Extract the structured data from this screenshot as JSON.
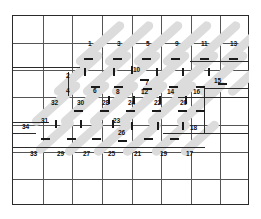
{
  "diagram": {
    "grid": {
      "columns": 8,
      "rows": 7,
      "cell_width": 29.6,
      "cell_height": 27.1,
      "line_color": "#555555",
      "frame_color": "#2b2b2b",
      "background": "#ffffff"
    },
    "hatch": {
      "color": "#dcdcdc",
      "angle_degrees": -42,
      "band_count": 7
    },
    "labels": {
      "top_row": [
        "1",
        "3",
        "5",
        "9",
        "11",
        "13"
      ],
      "second_row": [
        "2",
        "10",
        "7",
        "15"
      ],
      "third_row": [
        "4",
        "6",
        "8",
        "12",
        "14",
        "16"
      ],
      "fourth_row": [
        "32",
        "30",
        "28",
        "24",
        "22",
        "20"
      ],
      "fifth_row": [
        "34",
        "31",
        "23",
        "26",
        "18"
      ],
      "bottom_row": [
        "33",
        "29",
        "27",
        "25",
        "21",
        "19",
        "17"
      ],
      "all_values": [
        "1",
        "2",
        "3",
        "4",
        "5",
        "6",
        "7",
        "8",
        "9",
        "10",
        "11",
        "12",
        "13",
        "14",
        "15",
        "16",
        "17",
        "18",
        "19",
        "20",
        "21",
        "22",
        "23",
        "24",
        "25",
        "26",
        "27",
        "28",
        "29",
        "30",
        "31",
        "32",
        "33",
        "34"
      ]
    },
    "markers": [
      {
        "id": "1",
        "x": 88,
        "y": 45,
        "tick": "below"
      },
      {
        "id": "3",
        "x": 117,
        "y": 45,
        "tick": "below"
      },
      {
        "id": "5",
        "x": 146,
        "y": 45,
        "tick": "below"
      },
      {
        "id": "9",
        "x": 175,
        "y": 45,
        "tick": "below"
      },
      {
        "id": "11",
        "x": 204,
        "y": 45,
        "tick": "below"
      },
      {
        "id": "13",
        "x": 232,
        "y": 45,
        "tick": "below"
      },
      {
        "id": "2",
        "x": 68,
        "y": 78,
        "tick": "below"
      },
      {
        "id": "10",
        "x": 135,
        "y": 71,
        "tick": "above"
      },
      {
        "id": "7",
        "x": 144,
        "y": 84,
        "tick": "below"
      },
      {
        "id": "15",
        "x": 215,
        "y": 84,
        "tick": "below"
      },
      {
        "id": "4",
        "x": 68,
        "y": 93,
        "tick": "above"
      },
      {
        "id": "6",
        "x": 94,
        "y": 93,
        "tick": "above"
      },
      {
        "id": "8",
        "x": 117,
        "y": 95,
        "tick": "above"
      },
      {
        "id": "12",
        "x": 146,
        "y": 95,
        "tick": "above"
      },
      {
        "id": "14",
        "x": 175,
        "y": 95,
        "tick": "above"
      },
      {
        "id": "16",
        "x": 200,
        "y": 95,
        "tick": "above"
      },
      {
        "id": "32",
        "x": 54,
        "y": 105,
        "tick": "below"
      },
      {
        "id": "30",
        "x": 82,
        "y": 105,
        "tick": "below"
      },
      {
        "id": "28",
        "x": 106,
        "y": 105,
        "tick": "below"
      },
      {
        "id": "24",
        "x": 131,
        "y": 105,
        "tick": "below"
      },
      {
        "id": "22",
        "x": 157,
        "y": 105,
        "tick": "below"
      },
      {
        "id": "20",
        "x": 183,
        "y": 105,
        "tick": "below"
      },
      {
        "id": "34",
        "x": 24,
        "y": 128,
        "tick": "below"
      },
      {
        "id": "31",
        "x": 42,
        "y": 124,
        "tick": "left"
      },
      {
        "id": "23",
        "x": 116,
        "y": 123,
        "tick": "left"
      },
      {
        "id": "26",
        "x": 121,
        "y": 134,
        "tick": "above"
      },
      {
        "id": "18",
        "x": 192,
        "y": 129,
        "tick": "left"
      },
      {
        "id": "33",
        "x": 32,
        "y": 155,
        "tick": "none"
      },
      {
        "id": "29",
        "x": 59,
        "y": 155,
        "tick": "none"
      },
      {
        "id": "27",
        "x": 85,
        "y": 155,
        "tick": "none"
      },
      {
        "id": "25",
        "x": 109,
        "y": 155,
        "tick": "none"
      },
      {
        "id": "21",
        "x": 136,
        "y": 155,
        "tick": "none"
      },
      {
        "id": "19",
        "x": 162,
        "y": 155,
        "tick": "none"
      },
      {
        "id": "17",
        "x": 188,
        "y": 155,
        "tick": "none"
      }
    ]
  }
}
